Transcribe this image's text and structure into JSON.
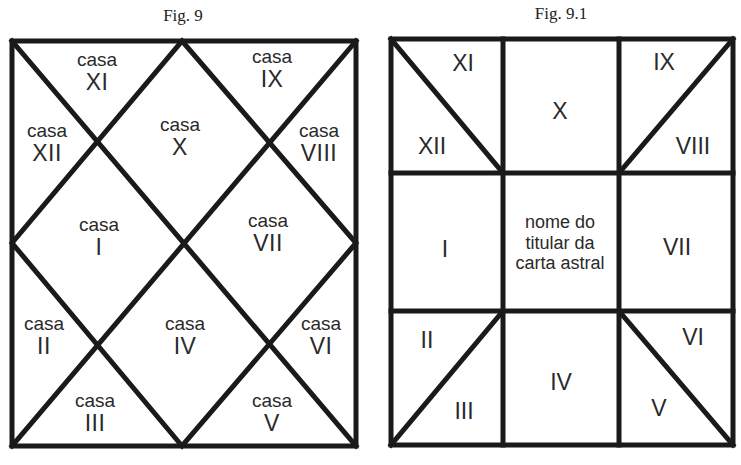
{
  "fig9": {
    "caption": "Fig. 9",
    "houses": [
      {
        "id": "XI",
        "word": "casa",
        "numeral": "XI"
      },
      {
        "id": "IX",
        "word": "casa",
        "numeral": "IX"
      },
      {
        "id": "XII",
        "word": "casa",
        "numeral": "XII"
      },
      {
        "id": "X",
        "word": "casa",
        "numeral": "X"
      },
      {
        "id": "VIII",
        "word": "casa",
        "numeral": "VIII"
      },
      {
        "id": "I",
        "word": "casa",
        "numeral": "I"
      },
      {
        "id": "VII",
        "word": "casa",
        "numeral": "VII"
      },
      {
        "id": "II",
        "word": "casa",
        "numeral": "II"
      },
      {
        "id": "IV",
        "word": "casa",
        "numeral": "IV"
      },
      {
        "id": "VI",
        "word": "casa",
        "numeral": "VI"
      },
      {
        "id": "III",
        "word": "casa",
        "numeral": "III"
      },
      {
        "id": "V",
        "word": "casa",
        "numeral": "V"
      }
    ]
  },
  "fig91": {
    "caption": "Fig. 9.1",
    "houses": {
      "XI": "XI",
      "XII": "XII",
      "X": "X",
      "IX": "IX",
      "VIII": "VIII",
      "I": "I",
      "VII": "VII",
      "II": "II",
      "III": "III",
      "IV": "IV",
      "VI": "VI",
      "V": "V"
    },
    "center_text": [
      "nome do",
      "titular da",
      "carta astral"
    ]
  },
  "colors": {
    "line": "#1a1a1a",
    "text": "#2a2a2a",
    "background": "#ffffff"
  }
}
